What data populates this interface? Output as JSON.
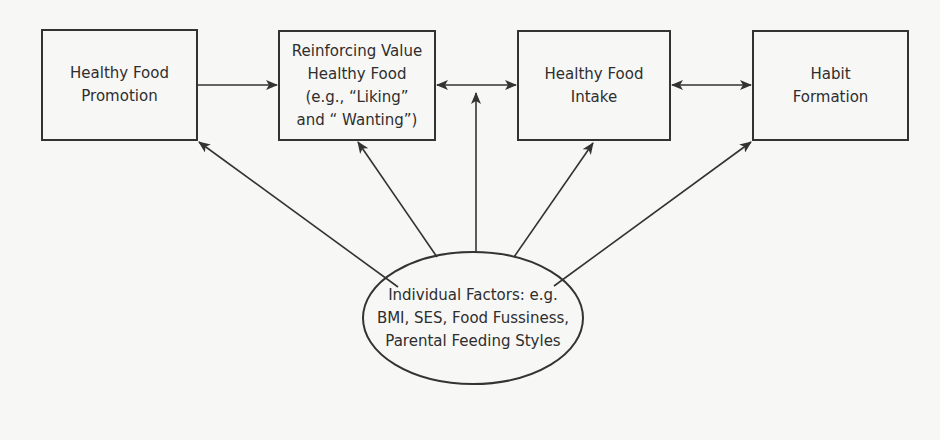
{
  "diagram": {
    "colors": {
      "background": "#f7f7f6",
      "stroke": "#333333",
      "text": "#2e2e2e"
    },
    "nodes": [
      {
        "id": "promotion",
        "label": "Healthy Food\nPromotion",
        "shape": "rect"
      },
      {
        "id": "reinforcing",
        "label": "Reinforcing Value\nHealthy Food\n(e.g., “Liking”\nand “ Wanting”)",
        "shape": "rect"
      },
      {
        "id": "intake",
        "label": "Healthy Food\nIntake",
        "shape": "rect"
      },
      {
        "id": "habit",
        "label": "Habit\nFormation",
        "shape": "rect"
      },
      {
        "id": "individual",
        "label": "Individual Factors: e.g.\nBMI, SES, Food Fussiness,\nParental Feeding Styles",
        "shape": "ellipse"
      }
    ],
    "edges": [
      {
        "from": "promotion",
        "to": "reinforcing",
        "direction": "forward"
      },
      {
        "from": "reinforcing",
        "to": "intake",
        "direction": "both"
      },
      {
        "from": "intake",
        "to": "habit",
        "direction": "both"
      },
      {
        "from": "individual",
        "to": "promotion",
        "direction": "forward"
      },
      {
        "from": "individual",
        "to": "reinforcing",
        "direction": "forward"
      },
      {
        "from": "individual",
        "to": "edge:reinforcing-intake",
        "direction": "forward"
      },
      {
        "from": "individual",
        "to": "intake",
        "direction": "forward"
      },
      {
        "from": "individual",
        "to": "habit",
        "direction": "forward"
      }
    ]
  }
}
